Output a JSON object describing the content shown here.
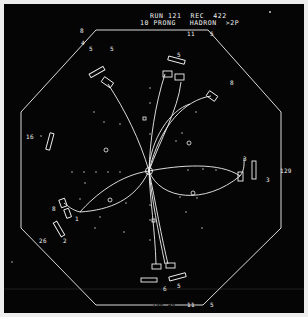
{
  "header": {
    "line1": "RUN 121  REC  422",
    "line2": "10 PRONG   HADRON  >2P"
  },
  "labels": [
    {
      "text": "8",
      "x": 80,
      "y": 28
    },
    {
      "text": "4",
      "x": 81,
      "y": 40
    },
    {
      "text": "5",
      "x": 89,
      "y": 46
    },
    {
      "text": "5",
      "x": 110,
      "y": 46
    },
    {
      "text": "11",
      "x": 187,
      "y": 31
    },
    {
      "text": "5",
      "x": 210,
      "y": 31
    },
    {
      "text": "5",
      "x": 177,
      "y": 52
    },
    {
      "text": "8",
      "x": 230,
      "y": 80
    },
    {
      "text": "16",
      "x": 26,
      "y": 134
    },
    {
      "text": "3",
      "x": 243,
      "y": 156
    },
    {
      "text": "3",
      "x": 266,
      "y": 177
    },
    {
      "text": "129",
      "x": 280,
      "y": 168
    },
    {
      "text": "8",
      "x": 52,
      "y": 206
    },
    {
      "text": "1",
      "x": 75,
      "y": 216
    },
    {
      "text": "26",
      "x": 39,
      "y": 238
    },
    {
      "text": "2",
      "x": 63,
      "y": 238
    },
    {
      "text": "6",
      "x": 163,
      "y": 286
    },
    {
      "text": "5",
      "x": 177,
      "y": 283
    },
    {
      "text": "11",
      "x": 187,
      "y": 302
    },
    {
      "text": "5",
      "x": 210,
      "y": 302
    }
  ],
  "bottom_label": "196 49",
  "colors": {
    "background": "#050505",
    "trace": "#f2f2f2",
    "margin": "#eeeeee"
  }
}
